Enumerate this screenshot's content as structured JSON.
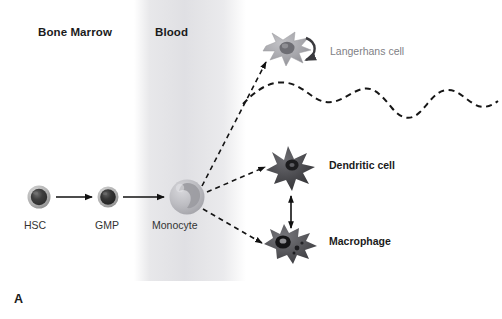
{
  "figure": {
    "panel_letter": "A",
    "width": 502,
    "height": 319,
    "background_color": "#ffffff"
  },
  "compartments": [
    {
      "key": "bone_marrow",
      "label": "Bone Marrow",
      "color": "#1b1b1b"
    },
    {
      "key": "blood",
      "label": "Blood",
      "color": "#1b1b1b",
      "band_color": "#e2e2e6"
    }
  ],
  "cells": [
    {
      "key": "hsc",
      "label": "HSC",
      "label_style": "dark",
      "shape": "round-cell",
      "fill_color": "#4a4a4a",
      "rim_color": "#b4b4b4",
      "cx": 39,
      "cy": 197,
      "r": 11
    },
    {
      "key": "gmp",
      "label": "GMP",
      "label_style": "dark",
      "shape": "round-cell",
      "fill_color": "#3c3c3c",
      "rim_color": "#9d9d9d",
      "cx": 108,
      "cy": 197,
      "r": 10
    },
    {
      "key": "monocyte",
      "label": "Monocyte",
      "label_style": "dark",
      "shape": "monocyte-cell",
      "fill_color": "#b9b9bd",
      "rim_color": "#cfcfd3",
      "nucleus_color": "#9a9a9e",
      "cx": 187,
      "cy": 197,
      "r": 17
    },
    {
      "key": "langerhans",
      "label": "Langerhans cell",
      "label_style": "grey",
      "shape": "dendritic-star",
      "fill_color": "#a9a9ad",
      "nucleus_color": "#6f6f74",
      "cx": 288,
      "cy": 50
    },
    {
      "key": "dendritic",
      "label": "Dendritic cell",
      "label_style": "dark",
      "shape": "dendritic-star",
      "fill_color": "#4c4c4f",
      "nucleus_color": "#1e1e20",
      "cx": 291,
      "cy": 166
    },
    {
      "key": "macrophage",
      "label": "Macrophage",
      "label_style": "dark",
      "shape": "macrophage-blob",
      "fill_color": "#58585c",
      "nucleus_color": "#141416",
      "cx": 290,
      "cy": 243
    }
  ],
  "connectors": [
    {
      "key": "hsc-to-gmp",
      "style": "solid-arrow",
      "from": "hsc",
      "to": "gmp"
    },
    {
      "key": "gmp-to-monocyte",
      "style": "solid-arrow",
      "from": "gmp",
      "to": "monocyte"
    },
    {
      "key": "monocyte-to-langerhans",
      "style": "dashed-arrow",
      "from": "monocyte",
      "to": "langerhans"
    },
    {
      "key": "monocyte-to-dendritic",
      "style": "dashed-arrow",
      "from": "monocyte",
      "to": "dendritic"
    },
    {
      "key": "monocyte-to-macrophage",
      "style": "dashed-arrow",
      "from": "monocyte",
      "to": "macrophage"
    },
    {
      "key": "dendritic-macrophage-interconvert",
      "style": "double-headed-arrow",
      "from": "dendritic",
      "to": "macrophage"
    }
  ],
  "skin_line": {
    "key": "epidermis-wave",
    "style": "dashed-wave",
    "color": "#1b1b1b",
    "description": "wavy dashed boundary line beneath Langerhans cell"
  }
}
